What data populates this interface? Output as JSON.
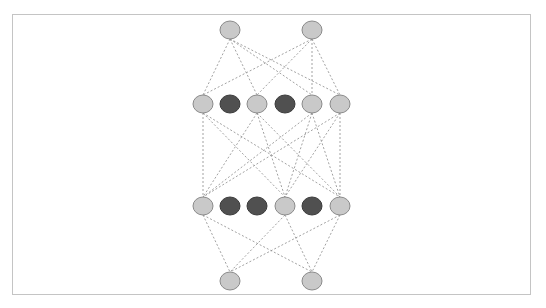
{
  "diagram": {
    "type": "neural-network-dropout",
    "frame": {
      "x": 12,
      "y": 14,
      "width": 519,
      "height": 281,
      "border_color": "#c4c4c4"
    },
    "node_style": {
      "rx": 10,
      "ry": 9,
      "active_fill": "#c9c9c9",
      "active_stroke": "#8a8a8a",
      "dropped_fill": "#505050",
      "dropped_stroke": "#3a3a3a",
      "edge_color": "#8a8a8a",
      "edge_dash": "2,2"
    },
    "layers": [
      {
        "name": "input-layer",
        "y": 30,
        "nodes": [
          {
            "x": 230,
            "state": "active"
          },
          {
            "x": 312,
            "state": "active"
          }
        ]
      },
      {
        "name": "hidden-layer-1",
        "y": 104,
        "nodes": [
          {
            "x": 203,
            "state": "active"
          },
          {
            "x": 230,
            "state": "dropped"
          },
          {
            "x": 257,
            "state": "active"
          },
          {
            "x": 285,
            "state": "dropped"
          },
          {
            "x": 312,
            "state": "active"
          },
          {
            "x": 340,
            "state": "active"
          }
        ]
      },
      {
        "name": "hidden-layer-2",
        "y": 206,
        "nodes": [
          {
            "x": 203,
            "state": "active"
          },
          {
            "x": 230,
            "state": "dropped"
          },
          {
            "x": 257,
            "state": "dropped"
          },
          {
            "x": 285,
            "state": "active"
          },
          {
            "x": 312,
            "state": "dropped"
          },
          {
            "x": 340,
            "state": "active"
          }
        ]
      },
      {
        "name": "output-layer",
        "y": 281,
        "nodes": [
          {
            "x": 230,
            "state": "active"
          },
          {
            "x": 312,
            "state": "active"
          }
        ]
      }
    ]
  }
}
